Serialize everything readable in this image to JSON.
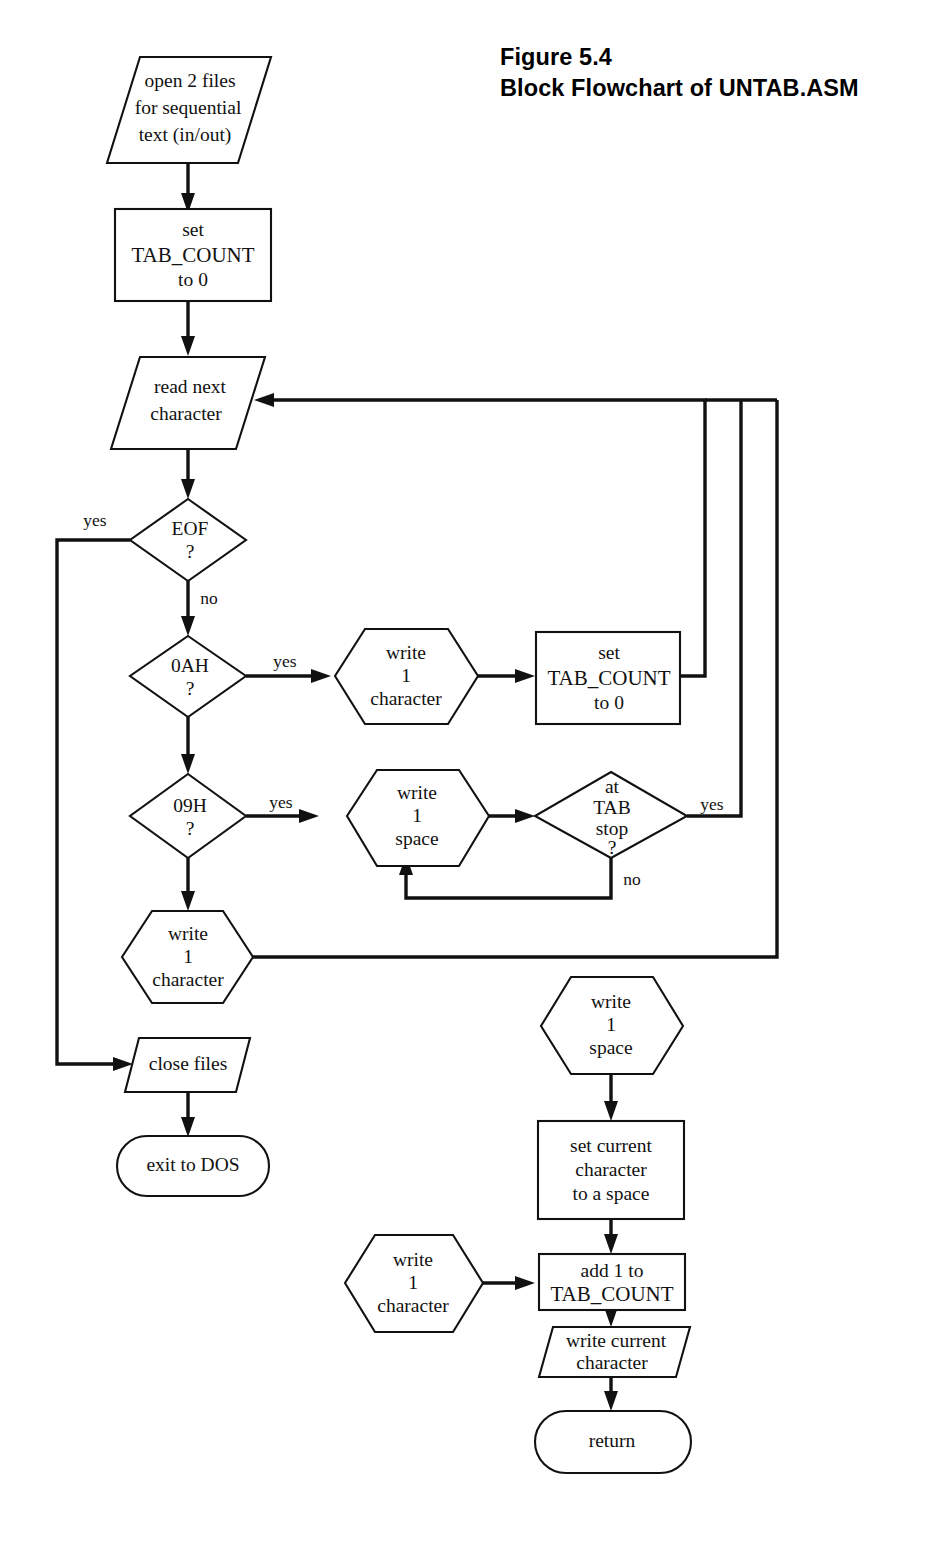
{
  "figure": {
    "number": "Figure 5.4",
    "caption": "Block Flowchart of UNTAB.ASM"
  },
  "colors": {
    "ink": "#111111",
    "paper": "#ffffff"
  },
  "nodes": {
    "open_files": {
      "shape": "parallelogram",
      "lines": [
        "open 2 files",
        "for sequential",
        "text (in/out)"
      ]
    },
    "set_tab_count_0_top": {
      "shape": "rectangle",
      "lines": [
        "set",
        "TAB_COUNT",
        "to 0"
      ]
    },
    "read_next_char": {
      "shape": "parallelogram",
      "lines": [
        "read next",
        "character"
      ]
    },
    "eof": {
      "shape": "diamond",
      "lines": [
        "EOF",
        "?"
      ]
    },
    "is_0ah": {
      "shape": "diamond",
      "lines": [
        "0AH",
        "?"
      ]
    },
    "write_1_char_0ah": {
      "shape": "hexagon",
      "lines": [
        "write",
        "1",
        "character"
      ]
    },
    "set_tab_count_0_mid": {
      "shape": "rectangle",
      "lines": [
        "set",
        "TAB_COUNT",
        "to 0"
      ]
    },
    "is_09h": {
      "shape": "diamond",
      "lines": [
        "09H",
        "?"
      ]
    },
    "write_1_space_09h": {
      "shape": "hexagon",
      "lines": [
        "write",
        "1",
        "space"
      ]
    },
    "at_tab_stop": {
      "shape": "diamond",
      "lines": [
        "at",
        "TAB",
        "stop",
        "?"
      ]
    },
    "write_1_char_main": {
      "shape": "hexagon",
      "lines": [
        "write",
        "1",
        "character"
      ]
    },
    "close_files": {
      "shape": "parallelogram",
      "lines": [
        "close files"
      ]
    },
    "exit_to_dos": {
      "shape": "terminator",
      "lines": [
        "exit to DOS"
      ]
    },
    "write_1_space_sub": {
      "shape": "hexagon",
      "lines": [
        "write",
        "1",
        "space"
      ]
    },
    "set_current_char_space": {
      "shape": "rectangle",
      "lines": [
        "set current",
        "character",
        "to a space"
      ]
    },
    "write_1_char_sub": {
      "shape": "hexagon",
      "lines": [
        "write",
        "1",
        "character"
      ]
    },
    "add_1_tab_count": {
      "shape": "rectangle",
      "lines": [
        "add 1 to",
        "TAB_COUNT"
      ]
    },
    "write_current_char": {
      "shape": "parallelogram",
      "lines": [
        "write current",
        "character"
      ]
    },
    "return": {
      "shape": "terminator",
      "lines": [
        "return"
      ]
    }
  },
  "edge_labels": {
    "eof_yes": "yes",
    "eof_no": "no",
    "zeroah_yes": "yes",
    "zero9h_yes": "yes",
    "tabstop_yes": "yes",
    "tabstop_no": "no"
  }
}
